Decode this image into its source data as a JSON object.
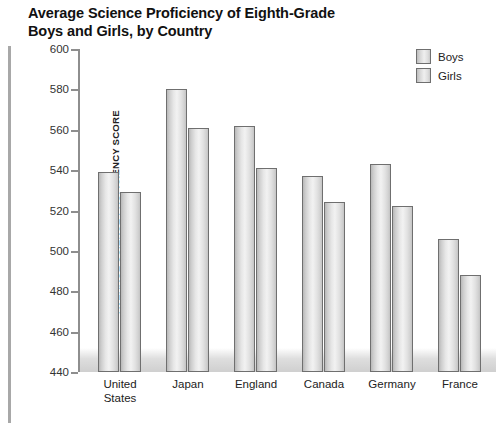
{
  "title": {
    "line1": "Average Science Proficiency of Eighth-Grade",
    "line2": "Boys and Girls, by Country"
  },
  "legend": {
    "items": [
      {
        "label": "Boys",
        "swatch": "legend-swatch-boys"
      },
      {
        "label": "Girls",
        "swatch": "legend-swatch-girls"
      }
    ]
  },
  "axis": {
    "ylabel": "AVERAGE SCIENCE PROFICIENCY SCORE",
    "yticks": [
      "600",
      "580",
      "560",
      "540",
      "520",
      "500",
      "480",
      "460",
      "440"
    ]
  },
  "categories": [
    {
      "line1": "United",
      "line2": "States"
    },
    {
      "line1": "Japan",
      "line2": ""
    },
    {
      "line1": "England",
      "line2": ""
    },
    {
      "line1": "Canada",
      "line2": ""
    },
    {
      "line1": "Germany",
      "line2": ""
    },
    {
      "line1": "France",
      "line2": ""
    }
  ],
  "chart_data": {
    "type": "bar",
    "title": "Average Science Proficiency of Eighth-Grade Boys and Girls, by Country",
    "xlabel": "",
    "ylabel": "AVERAGE SCIENCE PROFICIENCY SCORE",
    "categories": [
      "United States",
      "Japan",
      "England",
      "Canada",
      "Germany",
      "France"
    ],
    "series": [
      {
        "name": "Boys",
        "values": [
          539,
          580,
          562,
          537,
          543,
          506
        ]
      },
      {
        "name": "Girls",
        "values": [
          529,
          561,
          541,
          524,
          522,
          488
        ]
      }
    ],
    "ylim": [
      440,
      600
    ],
    "ytick_step": 20,
    "yticks": [
      440,
      460,
      480,
      500,
      520,
      540,
      560,
      580,
      600
    ],
    "grid": false,
    "legend_position": "top-right",
    "bar_fill": "#e6e6e6",
    "bar_border": "#6f6f6f"
  }
}
